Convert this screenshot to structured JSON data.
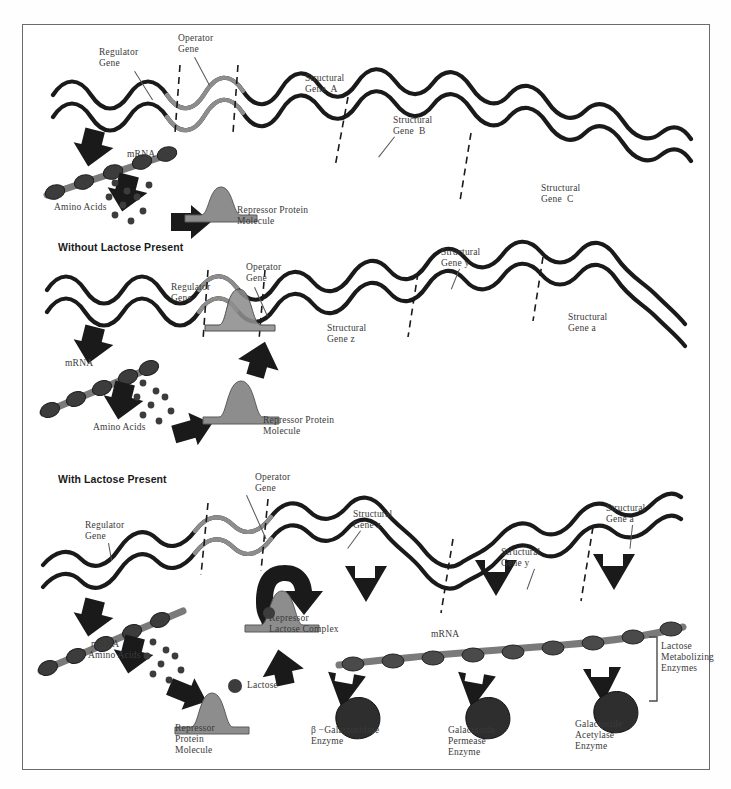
{
  "figure": {
    "background": "#ffffff",
    "border_color": "#6b6b6b",
    "ink_color": "#1a1a1a",
    "gray_fill": "#8d8d8d",
    "dark_fill": "#2b2b2b"
  },
  "panels": [
    {
      "id": "panel-top",
      "heading": "",
      "labels": {
        "regulator_gene": "Regulator\nGene",
        "operator_gene": "Operator\nGene",
        "structural_gene_a": "Structural\nGene  A",
        "structural_gene_b": "Structural\nGene  B",
        "structural_gene_c": "Structural\nGene  C",
        "mrna": "mRNA",
        "amino_acids": "Amino Acids",
        "repressor": "Repressor Protein\nMolecule"
      }
    },
    {
      "id": "panel-middle",
      "heading": "Without Lactose Present",
      "labels": {
        "regulator_gene": "Regulator\nGene",
        "operator_gene": "Operator\nGene",
        "structural_gene_z": "Structural\nGene z",
        "structural_gene_y": "Structural\nGene y",
        "structural_gene_a": "Structural\nGene a",
        "mrna": "mRNA",
        "amino_acids": "Amino Acids",
        "repressor": "Repressor Protein\nMolecule"
      }
    },
    {
      "id": "panel-bottom",
      "heading": "With Lactose Present",
      "labels": {
        "regulator_gene": "Regulator\nGene",
        "operator_gene": "Operator\nGene",
        "structural_gene_z": "Structural\nGene z",
        "structural_gene_y": "Structural\nGene y",
        "structural_gene_a": "Structural\nGene a",
        "mrna_left": "mRNA",
        "mrna_right": "mRNA",
        "amino_acids": "Amino Acids",
        "repressor_protein": "Repressor\nProtein\nMolecule",
        "repressor_lactose": "Repressor\nLactose Complex",
        "lactose": "Lactose",
        "enzyme_1": "β −Galactosidase\nEnzyme",
        "enzyme_2": "Galactoside\nPermease\nEnzyme",
        "enzyme_3": "Galactoside\nAcetylase\nEnzyme",
        "bracket": "Lactose\nMetabolizing\nEnzymes"
      }
    }
  ]
}
